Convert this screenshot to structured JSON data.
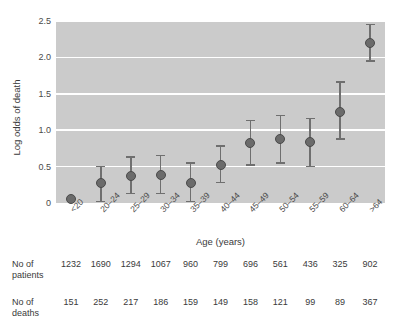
{
  "chart_data": {
    "type": "scatter",
    "title": "",
    "xlabel": "Age (years)",
    "ylabel": "Log odds of death",
    "ylim": [
      0,
      2.5
    ],
    "yticks": [
      0,
      0.5,
      1.0,
      1.5,
      2.0,
      2.5
    ],
    "ytick_labels": [
      "0",
      "0.5",
      "1.0",
      "1.5",
      "2.0",
      "2.5"
    ],
    "grid": "horizontal-white",
    "legend": "none",
    "categories": [
      "<20",
      "20–24",
      "25–29",
      "30–34",
      "35–39",
      "40–44",
      "45–49",
      "50–54",
      "55–59",
      "60–64",
      ">64"
    ],
    "values": [
      0.05,
      0.27,
      0.37,
      0.38,
      0.28,
      0.52,
      0.83,
      0.88,
      0.84,
      1.25,
      2.2
    ],
    "error_low": [
      0.05,
      0.02,
      0.13,
      0.13,
      0.02,
      0.28,
      0.52,
      0.55,
      0.5,
      0.88,
      1.95
    ],
    "error_high": [
      0.05,
      0.5,
      0.63,
      0.65,
      0.55,
      0.78,
      1.13,
      1.2,
      1.16,
      1.66,
      2.45
    ],
    "marker_color": "#6b6b6b",
    "errorbar_color": "#6f6f6f",
    "plot_background": "#cbcbcb",
    "gridline_color": "#ffffff"
  },
  "table": {
    "rows": [
      {
        "label_line1": "No of",
        "label_line2": "patients",
        "values": [
          "1232",
          "1690",
          "1294",
          "1067",
          "960",
          "799",
          "696",
          "561",
          "436",
          "325",
          "902"
        ]
      },
      {
        "label_line1": "No of",
        "label_line2": "deaths",
        "values": [
          "151",
          "252",
          "217",
          "186",
          "159",
          "149",
          "158",
          "121",
          "99",
          "89",
          "367"
        ]
      }
    ]
  }
}
